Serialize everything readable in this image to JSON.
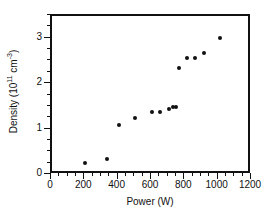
{
  "chart_data": {
    "type": "scatter",
    "title": "",
    "xlabel": "Power (W)",
    "ylabel_prefix": "Density (10",
    "ylabel_exp": "11",
    "ylabel_mid": " cm",
    "ylabel_exp2": "-3",
    "ylabel_suffix": ")",
    "ylabel_full": "Density (10^11 cm^-3)",
    "xlim": [
      0,
      1200
    ],
    "ylim": [
      0,
      3.5
    ],
    "x_major_ticks": [
      0,
      200,
      400,
      600,
      800,
      1000,
      1200
    ],
    "x_tick_labels": [
      "0",
      "200",
      "400",
      "600",
      "800",
      "1000",
      "1200"
    ],
    "x_minor_step": 50,
    "y_major_ticks": [
      0,
      1,
      2,
      3
    ],
    "y_tick_labels": [
      "0",
      "1",
      "2",
      "3"
    ],
    "y_minor_step": 0.25,
    "grid": false,
    "legend": null,
    "marker_color": "#111111",
    "frame_color": "#111111",
    "background": "#ffffff",
    "x": [
      200,
      330,
      400,
      500,
      600,
      645,
      700,
      725,
      745,
      760,
      810,
      860,
      910,
      1010
    ],
    "y": [
      0.26,
      0.35,
      1.1,
      1.26,
      1.39,
      1.39,
      1.45,
      1.49,
      1.5,
      2.36,
      2.58,
      2.58,
      2.68,
      3.02
    ],
    "points": [
      {
        "x": 200,
        "y": 0.26
      },
      {
        "x": 330,
        "y": 0.35
      },
      {
        "x": 400,
        "y": 1.1
      },
      {
        "x": 500,
        "y": 1.26
      },
      {
        "x": 600,
        "y": 1.39
      },
      {
        "x": 645,
        "y": 1.39
      },
      {
        "x": 700,
        "y": 1.45
      },
      {
        "x": 725,
        "y": 1.49
      },
      {
        "x": 745,
        "y": 1.5
      },
      {
        "x": 760,
        "y": 2.36
      },
      {
        "x": 810,
        "y": 2.58
      },
      {
        "x": 860,
        "y": 2.58
      },
      {
        "x": 910,
        "y": 2.68
      },
      {
        "x": 1010,
        "y": 3.02
      }
    ]
  }
}
